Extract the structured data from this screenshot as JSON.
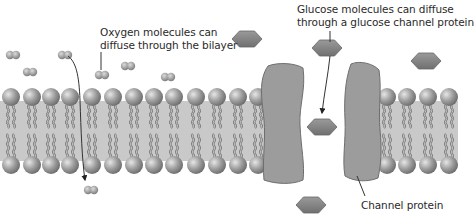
{
  "figure": {
    "labels": {
      "oxygen_line1": "Oxygen molecules can",
      "oxygen_line2": "diffuse through the bilayer",
      "glucose_line1": "Glucose molecules can diffuse",
      "glucose_line2": "through a glucose channel protein",
      "channel": "Channel protein"
    },
    "colors": {
      "membrane_band": "#c9c9c9",
      "head": "#9a9a9a",
      "tail": "#7d7d7d",
      "protein": "#9c9c9c",
      "protein_edge": "#6e6e6e",
      "glucose": "#8a8a8a",
      "oxygen": "#9a9a9a",
      "line": "#333333"
    },
    "head_x_left": [
      11,
      32,
      51,
      70,
      92,
      113,
      134,
      154,
      174,
      196,
      217,
      238,
      258
    ],
    "head_x_right": [
      387,
      407,
      428,
      449
    ],
    "oxygen_molecules": [
      [
        13,
        55
      ],
      [
        30,
        72
      ],
      [
        65,
        55
      ],
      [
        102,
        75
      ],
      [
        128,
        66
      ],
      [
        168,
        77
      ],
      [
        91,
        190
      ]
    ],
    "glucose_molecules": [
      [
        247,
        39
      ],
      [
        327,
        48
      ],
      [
        426,
        61
      ],
      [
        322,
        127
      ],
      [
        311,
        205
      ]
    ]
  }
}
